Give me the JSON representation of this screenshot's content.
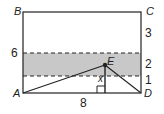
{
  "diagram": {
    "type": "geometry",
    "colors": {
      "line": "#222222",
      "band_fill": "#c8c8c8",
      "background": "#ffffff"
    },
    "points": {
      "A": "A",
      "B": "B",
      "C": "C",
      "D": "D",
      "E": "E"
    },
    "left_labels": {
      "six": "6"
    },
    "right_labels": {
      "top_segment": "3",
      "band_segment": "2",
      "bottom_segment": "1"
    },
    "bottom_label": "8",
    "height_variable": "x"
  }
}
